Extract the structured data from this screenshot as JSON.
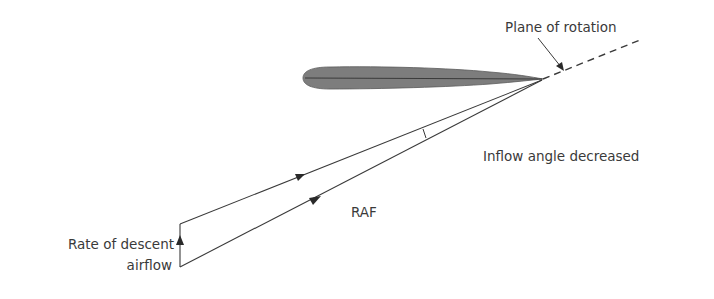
{
  "diagram": {
    "labels": {
      "plane_of_rotation": "Plane of rotation",
      "inflow_angle": "Inflow angle decreased",
      "raf": "RAF",
      "rate_of_descent_line1": "Rate of descent",
      "rate_of_descent_line2": "airflow"
    },
    "colors": {
      "line": "#3a3a3a",
      "airfoil_fill": "#7a7a7a",
      "text": "#3a3a3a",
      "background": "#ffffff"
    }
  }
}
